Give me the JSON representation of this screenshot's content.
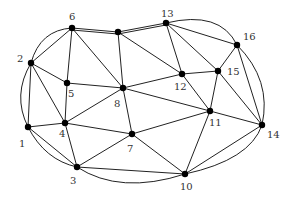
{
  "diagram": {
    "type": "planar-graph",
    "colors": {
      "edge": "#222222",
      "node": "#000000",
      "label": "#333333",
      "background": "#ffffff"
    },
    "nodes": [
      {
        "id": "1",
        "label": "1",
        "x": 28,
        "y": 127,
        "lx": 19,
        "ly": 147
      },
      {
        "id": "2",
        "label": "2",
        "x": 31,
        "y": 63,
        "lx": 17,
        "ly": 62
      },
      {
        "id": "3",
        "label": "3",
        "x": 77,
        "y": 167,
        "lx": 70,
        "ly": 184
      },
      {
        "id": "4",
        "label": "4",
        "x": 65,
        "y": 123,
        "lx": 59,
        "ly": 137
      },
      {
        "id": "5",
        "label": "5",
        "x": 67,
        "y": 83,
        "lx": 68,
        "ly": 97
      },
      {
        "id": "6",
        "label": "6",
        "x": 72,
        "y": 28,
        "lx": 69,
        "ly": 20
      },
      {
        "id": "u",
        "label": "",
        "x": 118,
        "y": 32,
        "lx": 0,
        "ly": 0
      },
      {
        "id": "7",
        "label": "7",
        "x": 132,
        "y": 134,
        "lx": 127,
        "ly": 152
      },
      {
        "id": "8",
        "label": "8",
        "x": 123,
        "y": 88,
        "lx": 114,
        "ly": 107
      },
      {
        "id": "10",
        "label": "10",
        "x": 185,
        "y": 174,
        "lx": 180,
        "ly": 190
      },
      {
        "id": "11",
        "label": "11",
        "x": 210,
        "y": 111,
        "lx": 209,
        "ly": 126
      },
      {
        "id": "12",
        "label": "12",
        "x": 182,
        "y": 74,
        "lx": 174,
        "ly": 90
      },
      {
        "id": "13",
        "label": "13",
        "x": 166,
        "y": 23,
        "lx": 161,
        "ly": 17
      },
      {
        "id": "14",
        "label": "14",
        "x": 262,
        "y": 125,
        "lx": 267,
        "ly": 138
      },
      {
        "id": "15",
        "label": "15",
        "x": 218,
        "y": 71,
        "lx": 227,
        "ly": 75
      },
      {
        "id": "16",
        "label": "16",
        "x": 237,
        "y": 45,
        "lx": 243,
        "ly": 40
      }
    ],
    "edges": [
      [
        "2",
        "6"
      ],
      [
        "2",
        "5"
      ],
      [
        "2",
        "4"
      ],
      [
        "2",
        "1"
      ],
      [
        "6",
        "5"
      ],
      [
        "6",
        "8"
      ],
      [
        "6",
        "u"
      ],
      [
        "u",
        "8"
      ],
      [
        "u",
        "12"
      ],
      [
        "u",
        "13"
      ],
      [
        "13",
        "12"
      ],
      [
        "13",
        "15"
      ],
      [
        "13",
        "16"
      ],
      [
        "16",
        "15"
      ],
      [
        "16",
        "14"
      ],
      [
        "15",
        "12"
      ],
      [
        "15",
        "11"
      ],
      [
        "15",
        "14"
      ],
      [
        "12",
        "8"
      ],
      [
        "12",
        "11"
      ],
      [
        "8",
        "5"
      ],
      [
        "8",
        "4"
      ],
      [
        "8",
        "7"
      ],
      [
        "8",
        "11"
      ],
      [
        "5",
        "4"
      ],
      [
        "4",
        "1"
      ],
      [
        "4",
        "3"
      ],
      [
        "4",
        "7"
      ],
      [
        "1",
        "3"
      ],
      [
        "3",
        "7"
      ],
      [
        "3",
        "10"
      ],
      [
        "7",
        "10"
      ],
      [
        "7",
        "11"
      ],
      [
        "11",
        "10"
      ],
      [
        "11",
        "14"
      ],
      [
        "10",
        "14"
      ]
    ],
    "parallel_edges": [
      {
        "from": "6",
        "to": "u",
        "d": "M72,30 L118,34"
      },
      {
        "from": "u",
        "to": "13",
        "d": "M118,34 L166,25"
      }
    ],
    "curved_edges": [
      {
        "from": "2",
        "to": "6",
        "d": "M31,63 Q40,30 72,28"
      },
      {
        "from": "2",
        "to": "1",
        "d": "M31,63 Q12,95 28,127"
      },
      {
        "from": "1",
        "to": "3",
        "d": "M28,127 Q45,160 77,167"
      },
      {
        "from": "3",
        "to": "10",
        "d": "M77,167 Q120,195 185,174"
      },
      {
        "from": "10",
        "to": "14",
        "d": "M185,174 Q250,160 262,125"
      },
      {
        "from": "16",
        "to": "14",
        "d": "M237,45 Q272,80 262,125"
      },
      {
        "from": "13",
        "to": "16",
        "d": "M166,23 Q220,10 237,45"
      }
    ]
  }
}
